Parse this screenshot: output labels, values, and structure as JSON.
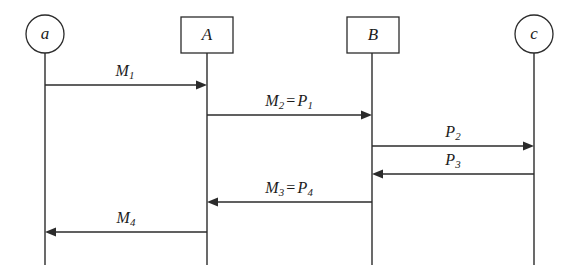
{
  "diagram": {
    "type": "sequence-diagram",
    "width": 579,
    "height": 275,
    "background_color": "#ffffff",
    "stroke_color": "#2b2b2b",
    "text_color": "#1c1c1c",
    "participants": [
      {
        "id": "a",
        "label": "a",
        "shape": "circle",
        "x": 45,
        "y": 34,
        "radius": 19,
        "lifeline_top": 53,
        "lifeline_bottom": 265
      },
      {
        "id": "A",
        "label": "A",
        "shape": "rect",
        "x": 207,
        "y": 35,
        "box_x": 181,
        "box_y": 17,
        "box_w": 52,
        "box_h": 36,
        "lifeline_top": 53,
        "lifeline_bottom": 265
      },
      {
        "id": "B",
        "label": "B",
        "shape": "rect",
        "x": 372,
        "y": 35,
        "box_x": 347,
        "box_y": 17,
        "box_w": 52,
        "box_h": 36,
        "lifeline_top": 53,
        "lifeline_bottom": 265
      },
      {
        "id": "c",
        "label": "c",
        "shape": "circle",
        "x": 534,
        "y": 34,
        "radius": 19,
        "lifeline_top": 53,
        "lifeline_bottom": 265
      }
    ],
    "messages": [
      {
        "id": "m1",
        "label_main": "M",
        "label_sub": "1",
        "label_extra": "",
        "label_extra_sub": "",
        "from": "a",
        "to": "A",
        "x1": 45,
        "x2": 207,
        "y": 85,
        "direction": "right",
        "label_x": 125,
        "label_y": 79
      },
      {
        "id": "m2",
        "label_main": "M",
        "label_sub": "2",
        "label_extra": "P",
        "label_extra_sub": "1",
        "from": "A",
        "to": "B",
        "x1": 207,
        "x2": 372,
        "y": 115,
        "direction": "right",
        "label_x": 289,
        "label_y": 109
      },
      {
        "id": "p2",
        "label_main": "P",
        "label_sub": "2",
        "label_extra": "",
        "label_extra_sub": "",
        "from": "B",
        "to": "c",
        "x1": 372,
        "x2": 534,
        "y": 146,
        "direction": "right",
        "label_x": 453,
        "label_y": 140
      },
      {
        "id": "p3",
        "label_main": "P",
        "label_sub": "3",
        "label_extra": "",
        "label_extra_sub": "",
        "from": "c",
        "to": "B",
        "x1": 534,
        "x2": 372,
        "y": 174,
        "direction": "left",
        "label_x": 453,
        "label_y": 168
      },
      {
        "id": "m3",
        "label_main": "M",
        "label_sub": "3",
        "label_extra": "P",
        "label_extra_sub": "4",
        "from": "B",
        "to": "A",
        "x1": 372,
        "x2": 207,
        "y": 202,
        "direction": "left",
        "label_x": 289,
        "label_y": 196
      },
      {
        "id": "m4",
        "label_main": "M",
        "label_sub": "4",
        "label_extra": "",
        "label_extra_sub": "",
        "from": "A",
        "to": "a",
        "x1": 207,
        "x2": 45,
        "y": 232,
        "direction": "left",
        "label_x": 126,
        "label_y": 226
      }
    ],
    "equals_sign": "="
  }
}
